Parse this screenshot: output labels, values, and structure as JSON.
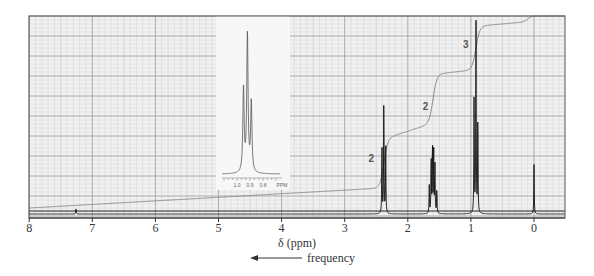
{
  "chart_data": {
    "type": "line",
    "title": "",
    "subtitle": "1H NMR spectrum with integration curve",
    "xlabel": "δ (ppm)",
    "xlabel_secondary": "frequency",
    "xlabel_secondary_arrow": "left",
    "ylabel": "",
    "xlim": [
      8,
      -0.5
    ],
    "x_reversed": true,
    "xticks": [
      8,
      7,
      6,
      5,
      4,
      3,
      2,
      1,
      0
    ],
    "xtick_labels": [
      "8",
      "7",
      "6",
      "5",
      "4",
      "3",
      "2",
      "1",
      "0"
    ],
    "grid": true,
    "legend": null,
    "colors": {
      "grid_major": "#9a9a9a",
      "grid_minor": "#d2d2d2",
      "background": "#f1f1f1",
      "spectrum": "#111111",
      "integral": "#888888",
      "frame": "#555555"
    },
    "peaks": [
      {
        "ppm": 2.38,
        "multiplicity": "triplet",
        "relative_height": 0.58,
        "integration": 2,
        "lines": [
          2.41,
          2.38,
          2.35
        ],
        "line_heights": [
          0.35,
          0.58,
          0.34
        ]
      },
      {
        "ppm": 1.6,
        "multiplicity": "sextet",
        "relative_height": 0.36,
        "integration": 2,
        "lines": [
          1.66,
          1.63,
          1.61,
          1.59,
          1.57,
          1.54
        ],
        "line_heights": [
          0.14,
          0.3,
          0.36,
          0.34,
          0.26,
          0.12
        ]
      },
      {
        "ppm": 0.92,
        "multiplicity": "triplet",
        "relative_height": 1.0,
        "integration": 3,
        "lines": [
          0.95,
          0.92,
          0.89
        ],
        "line_heights": [
          0.6,
          1.0,
          0.5
        ]
      },
      {
        "ppm": 0.0,
        "multiplicity": "singlet",
        "label": "TMS",
        "relative_height": 0.25,
        "lines": [
          0.0
        ],
        "line_heights": [
          0.25
        ]
      },
      {
        "ppm": 7.26,
        "multiplicity": "singlet",
        "relative_height": 0.03,
        "lines": [
          7.26
        ],
        "line_heights": [
          0.03
        ]
      }
    ],
    "integration_labels": [
      {
        "text": "2",
        "ppm": 2.58,
        "y_frac": 0.27
      },
      {
        "text": "2",
        "ppm": 1.72,
        "y_frac": 0.53
      },
      {
        "text": "3",
        "ppm": 1.08,
        "y_frac": 0.84
      }
    ],
    "integral_curve": {
      "steps": [
        {
          "ppm": 2.38,
          "from": 0.12,
          "to": 0.37
        },
        {
          "ppm": 1.6,
          "from": 0.44,
          "to": 0.69
        },
        {
          "ppm": 0.92,
          "from": 0.71,
          "to": 0.93
        },
        {
          "ppm": 0.1,
          "from": 0.95,
          "to": 0.98
        }
      ]
    },
    "inset": {
      "description": "expansion of 0.92 ppm triplet",
      "xtick_labels": [
        "1.0",
        "0.9",
        "0.8",
        "PPM"
      ],
      "xlim": [
        1.1,
        0.7
      ],
      "peaks": [
        0.95,
        0.92,
        0.89
      ],
      "peak_heights": [
        0.6,
        1.0,
        0.5
      ]
    }
  }
}
